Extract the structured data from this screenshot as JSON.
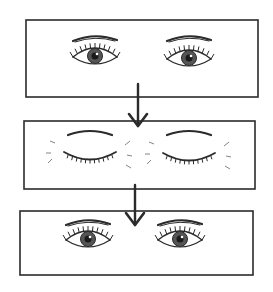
{
  "diagram": {
    "ink_color": "#2b2b2b",
    "background": "#ffffff",
    "panels": [
      {
        "id": "panel-open-1",
        "state": "open",
        "box": {
          "x": 26,
          "y": 20,
          "w": 232,
          "h": 77
        },
        "eyes": [
          {
            "cx": 95,
            "cy": 57,
            "brow_y": 37
          },
          {
            "cx": 189,
            "cy": 59,
            "brow_y": 37
          }
        ]
      },
      {
        "id": "panel-closed",
        "state": "closed",
        "box": {
          "x": 24,
          "y": 121,
          "w": 231,
          "h": 68
        },
        "eyes": [
          {
            "cx": 90,
            "cy": 155,
            "brow_y": 132
          },
          {
            "cx": 189,
            "cy": 156,
            "brow_y": 132
          }
        ],
        "motion_lines": true
      },
      {
        "id": "panel-open-2",
        "state": "open",
        "box": {
          "x": 20,
          "y": 211,
          "w": 233,
          "h": 64
        },
        "eyes": [
          {
            "cx": 88,
            "cy": 240,
            "brow_y": 221
          },
          {
            "cx": 180,
            "cy": 240,
            "brow_y": 221
          }
        ]
      }
    ],
    "arrows": [
      {
        "id": "arrow-1-to-2",
        "x": 138,
        "y1": 84,
        "y2": 126
      },
      {
        "id": "arrow-2-to-3",
        "x": 135,
        "y1": 185,
        "y2": 225
      }
    ]
  }
}
